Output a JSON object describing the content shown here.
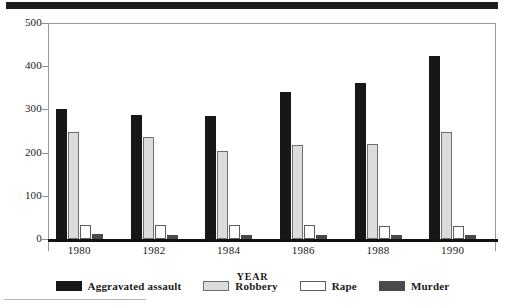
{
  "chart_data": {
    "type": "bar",
    "title": "",
    "xlabel": "YEAR",
    "ylabel": "",
    "categories": [
      "1980",
      "1982",
      "1984",
      "1986",
      "1988",
      "1990"
    ],
    "series": [
      {
        "name": "Aggravated assault",
        "color": "#171717",
        "values": [
          300,
          286,
          285,
          340,
          361,
          423
        ]
      },
      {
        "name": "Robbery",
        "color": "#dcdcdc",
        "values": [
          248,
          236,
          204,
          217,
          220,
          247
        ]
      },
      {
        "name": "Rape",
        "color": "#ffffff",
        "values": [
          32,
          32,
          32,
          32,
          31,
          30
        ]
      },
      {
        "name": "Murder",
        "color": "#4a4a4a",
        "values": [
          11,
          10,
          10,
          10,
          9,
          9
        ]
      }
    ],
    "ylim": [
      0,
      500
    ],
    "yticks": [
      0,
      100,
      200,
      300,
      400,
      500
    ],
    "ytick_labels": [
      "0",
      "100",
      "200",
      "300",
      "400",
      "500"
    ],
    "grid": false,
    "legend_position": "bottom"
  },
  "axes": {
    "y_tick_labels": [
      "500",
      "400",
      "300",
      "200",
      "100",
      "0"
    ],
    "x_tick_labels": [
      "1980",
      "1982",
      "1984",
      "1986",
      "1988",
      "1990"
    ],
    "x_axis_title": "YEAR"
  },
  "legend": {
    "items": [
      {
        "label": "Aggravated assault",
        "swatch": "assault"
      },
      {
        "label": "Robbery",
        "swatch": "robbery"
      },
      {
        "label": "Rape",
        "swatch": "rape"
      },
      {
        "label": "Murder",
        "swatch": "murder"
      }
    ]
  }
}
